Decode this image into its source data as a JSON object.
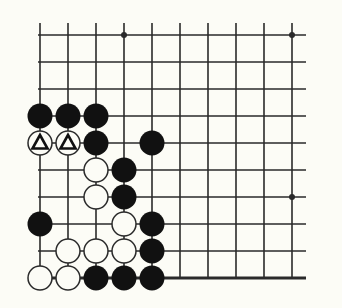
{
  "diagram": {
    "type": "go-board-corner",
    "cols": 10,
    "rows": 10,
    "origin": {
      "x": 40,
      "y": 35
    },
    "spacing": {
      "x": 28,
      "y": 27
    },
    "star_points": [
      {
        "c": 3,
        "r": 0
      },
      {
        "c": 9,
        "r": 0
      },
      {
        "c": 9,
        "r": 6
      }
    ],
    "edges": {
      "left": false,
      "bottom": true,
      "right": false,
      "top": false
    },
    "stones": [
      {
        "c": 0,
        "r": 3,
        "color": "black"
      },
      {
        "c": 1,
        "r": 3,
        "color": "black"
      },
      {
        "c": 2,
        "r": 3,
        "color": "black"
      },
      {
        "c": 0,
        "r": 4,
        "color": "white",
        "mark": "triangle"
      },
      {
        "c": 1,
        "r": 4,
        "color": "white",
        "mark": "triangle"
      },
      {
        "c": 2,
        "r": 4,
        "color": "black"
      },
      {
        "c": 4,
        "r": 4,
        "color": "black"
      },
      {
        "c": 2,
        "r": 5,
        "color": "white"
      },
      {
        "c": 3,
        "r": 5,
        "color": "black"
      },
      {
        "c": 2,
        "r": 6,
        "color": "white"
      },
      {
        "c": 3,
        "r": 6,
        "color": "black"
      },
      {
        "c": 0,
        "r": 7,
        "color": "black"
      },
      {
        "c": 3,
        "r": 7,
        "color": "white"
      },
      {
        "c": 4,
        "r": 7,
        "color": "black"
      },
      {
        "c": 1,
        "r": 8,
        "color": "white"
      },
      {
        "c": 2,
        "r": 8,
        "color": "white"
      },
      {
        "c": 3,
        "r": 8,
        "color": "white"
      },
      {
        "c": 4,
        "r": 8,
        "color": "black"
      },
      {
        "c": 0,
        "r": 9,
        "color": "white"
      },
      {
        "c": 1,
        "r": 9,
        "color": "white"
      },
      {
        "c": 2,
        "r": 9,
        "color": "black"
      },
      {
        "c": 3,
        "r": 9,
        "color": "black"
      },
      {
        "c": 4,
        "r": 9,
        "color": "black"
      }
    ],
    "colors": {
      "line": "#2a2a2a",
      "black_stone": "#111111",
      "white_stone": "#fcfcf6",
      "background": "#fcfcf6"
    }
  }
}
